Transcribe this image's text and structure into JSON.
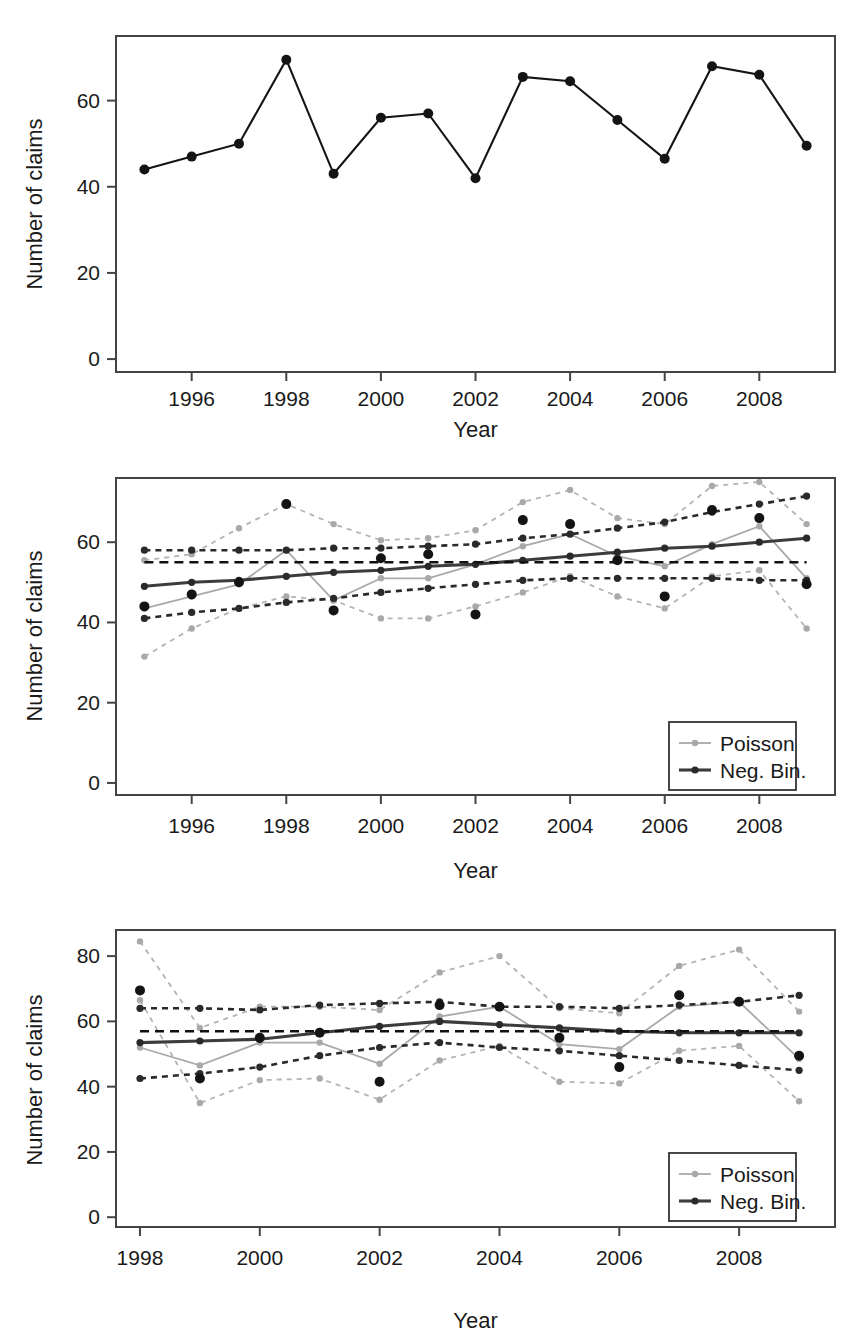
{
  "figure": {
    "panel_count": 3,
    "shared_axis_labels": {
      "x": "Year",
      "y": "Number of claims"
    }
  },
  "legend": {
    "poisson_label": "Poisson",
    "negbin_label": "Neg. Bin.",
    "poisson_color": "#a9a9a9",
    "negbin_color": "#2a2a2a"
  },
  "chart_data": [
    {
      "id": "panel-observed",
      "type": "line",
      "title": "",
      "xlabel": "Year",
      "ylabel": "Number of claims",
      "xlim": [
        1994.4,
        2009.6
      ],
      "ylim": [
        -3,
        75
      ],
      "xticks": [
        1996,
        1998,
        2000,
        2002,
        2004,
        2006,
        2008
      ],
      "xticklabels": [
        "1996",
        "1998",
        "2000",
        "2002",
        "2004",
        "2006",
        "2008"
      ],
      "yticks": [
        0,
        20,
        40,
        60
      ],
      "yticklabels": [
        "0",
        "20",
        "40",
        "60"
      ],
      "grid": false,
      "legend_position": "none",
      "x": [
        1995,
        1996,
        1997,
        1998,
        1999,
        2000,
        2001,
        2002,
        2003,
        2004,
        2005,
        2006,
        2007,
        2008,
        2009
      ],
      "series": [
        {
          "name": "Observed claims",
          "style": "solid-with-points",
          "color": "#141414",
          "values": [
            44,
            47,
            50,
            69.5,
            43,
            56,
            57,
            42,
            65.5,
            64.5,
            55.5,
            46.5,
            68,
            66,
            49.5
          ]
        }
      ]
    },
    {
      "id": "panel-in-sample",
      "type": "line",
      "title": "",
      "xlabel": "Year",
      "ylabel": "Number of claims",
      "xlim": [
        1994.4,
        2009.6
      ],
      "ylim": [
        -3,
        76
      ],
      "xticks": [
        1996,
        1998,
        2000,
        2002,
        2004,
        2006,
        2008
      ],
      "xticklabels": [
        "1996",
        "1998",
        "2000",
        "2002",
        "2004",
        "2006",
        "2008"
      ],
      "yticks": [
        0,
        20,
        40,
        60
      ],
      "yticklabels": [
        "0",
        "20",
        "40",
        "60"
      ],
      "grid": false,
      "legend_position": "lower-right",
      "legend_entries": [
        "Poisson",
        "Neg. Bin."
      ],
      "x": [
        1995,
        1996,
        1997,
        1998,
        1999,
        2000,
        2001,
        2002,
        2003,
        2004,
        2005,
        2006,
        2007,
        2008,
        2009
      ],
      "series": [
        {
          "name": "Poisson observed",
          "style": "solid-with-points",
          "color": "#a9a9a9",
          "values": [
            43.5,
            46.5,
            49.5,
            58,
            45.5,
            51,
            51,
            54.5,
            59,
            62,
            56.5,
            54,
            59.5,
            64,
            51
          ]
        },
        {
          "name": "Poisson upper",
          "style": "dashed",
          "color": "#b4b4b4",
          "values": [
            55.5,
            57,
            63.5,
            69.5,
            64.5,
            60.5,
            61,
            63,
            70,
            73,
            66,
            64.5,
            74,
            75,
            64.5
          ]
        },
        {
          "name": "Poisson lower",
          "style": "dashed",
          "color": "#b4b4b4",
          "values": [
            31.5,
            38.5,
            43.5,
            46.5,
            45.5,
            41,
            41,
            44,
            47.5,
            51.5,
            46.5,
            43.5,
            51.5,
            53,
            38.5
          ]
        },
        {
          "name": "Neg. Bin. fitted",
          "style": "solid-with-points",
          "color": "#3c3c3c",
          "values": [
            49,
            50,
            50.5,
            51.5,
            52.5,
            53,
            54,
            54.5,
            55.5,
            56.5,
            57.5,
            58.5,
            59,
            60,
            61
          ]
        },
        {
          "name": "Neg. Bin. upper",
          "style": "dashed",
          "color": "#2a2a2a",
          "values": [
            58,
            58,
            58,
            58,
            58.5,
            58.5,
            59,
            59.5,
            61,
            62,
            63.5,
            65,
            67.5,
            69.5,
            71.5
          ]
        },
        {
          "name": "Neg. Bin. lower",
          "style": "dashed",
          "color": "#2a2a2a",
          "values": [
            41,
            42.5,
            43.5,
            45,
            46,
            47.5,
            48.5,
            49.5,
            50.5,
            51,
            51,
            51,
            51,
            50.5,
            50.5
          ]
        },
        {
          "name": "Overall mean",
          "style": "dashed-horizontal",
          "color": "#111",
          "values": [
            55,
            55,
            55,
            55,
            55,
            55,
            55,
            55,
            55,
            55,
            55,
            55,
            55,
            55,
            55
          ]
        },
        {
          "name": "Observed claims",
          "style": "points-only",
          "color": "#141414",
          "values": [
            44,
            47,
            50,
            69.5,
            43,
            56,
            57,
            42,
            65.5,
            64.5,
            55.5,
            46.5,
            68,
            66,
            49.5
          ]
        }
      ]
    },
    {
      "id": "panel-out-of-sample",
      "type": "line",
      "title": "",
      "xlabel": "Year",
      "ylabel": "Number of claims",
      "xlim": [
        1997.6,
        2009.6
      ],
      "ylim": [
        -3,
        88
      ],
      "xticks": [
        1998,
        2000,
        2002,
        2004,
        2006,
        2008
      ],
      "xticklabels": [
        "1998",
        "2000",
        "2002",
        "2004",
        "2006",
        "2008"
      ],
      "yticks": [
        0,
        20,
        40,
        60,
        80
      ],
      "yticklabels": [
        "0",
        "20",
        "40",
        "60",
        "80"
      ],
      "grid": false,
      "legend_position": "lower-right",
      "legend_entries": [
        "Poisson",
        "Neg. Bin."
      ],
      "x": [
        1998,
        1999,
        2000,
        2001,
        2002,
        2003,
        2004,
        2005,
        2006,
        2007,
        2008,
        2009
      ],
      "series": [
        {
          "name": "Poisson predicted",
          "style": "solid-with-points",
          "color": "#a9a9a9",
          "values": [
            52,
            46.5,
            53.5,
            53.5,
            47,
            61.5,
            64.5,
            53,
            51.5,
            64.5,
            66,
            48.5
          ]
        },
        {
          "name": "Poisson upper",
          "style": "dashed",
          "color": "#b4b4b4",
          "values": [
            84.5,
            58,
            64.5,
            64.5,
            63.5,
            75,
            80,
            64,
            62.5,
            77,
            82,
            63
          ]
        },
        {
          "name": "Poisson lower",
          "style": "dashed",
          "color": "#b4b4b4",
          "values": [
            66.5,
            35,
            42,
            42.5,
            36,
            48,
            52.5,
            41.5,
            41,
            51,
            52.5,
            35.5
          ]
        },
        {
          "name": "Neg. Bin. predicted",
          "style": "solid-with-points",
          "color": "#3c3c3c",
          "values": [
            53.5,
            54,
            54.5,
            56.5,
            58.5,
            60,
            59,
            58,
            57,
            56.5,
            56.5,
            56.5
          ]
        },
        {
          "name": "Neg. Bin. upper",
          "style": "dashed",
          "color": "#2a2a2a",
          "values": [
            64,
            64,
            63.5,
            65,
            65.5,
            66,
            64.5,
            64.5,
            64,
            65,
            66,
            68
          ]
        },
        {
          "name": "Neg. Bin. lower",
          "style": "dashed",
          "color": "#2a2a2a",
          "values": [
            42.5,
            44,
            46,
            49.5,
            52,
            53.5,
            52,
            51,
            49.5,
            48,
            46.5,
            45
          ]
        },
        {
          "name": "Overall mean",
          "style": "dashed-horizontal",
          "color": "#111",
          "values": [
            57,
            57,
            57,
            57,
            57,
            57,
            57,
            57,
            57,
            57,
            57,
            57
          ]
        },
        {
          "name": "Observed claims",
          "style": "points-only",
          "color": "#141414",
          "values": [
            69.5,
            42.5,
            55,
            56.5,
            41.5,
            65,
            64.5,
            55,
            46,
            68,
            66,
            49.5
          ]
        }
      ]
    }
  ]
}
